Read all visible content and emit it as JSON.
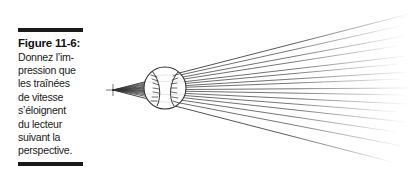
{
  "figure": {
    "label": "Figure 11-6:",
    "caption_lines": [
      "Donnez l’im-",
      "pression que",
      "les traînées",
      "de vitesse",
      "s’éloignent",
      "du lecteur",
      "suivant la",
      "perspective."
    ],
    "caption_text": "Donnez l’impression que les traînées de vitesse s’éloignent du lecteur suivant la perspective.",
    "rule_color": "#1a1a1a",
    "text_color": "#1c1c1c"
  },
  "illustration": {
    "subject": "baseball-with-speed-lines",
    "line_color": "#3a3a3a",
    "ball": {
      "center_x": 165,
      "center_y": 88,
      "radius": 21,
      "outline_color": "#2e2e2e"
    },
    "vanishing_point": {
      "x": 113,
      "y": 90
    },
    "speed_line_count": 16
  }
}
